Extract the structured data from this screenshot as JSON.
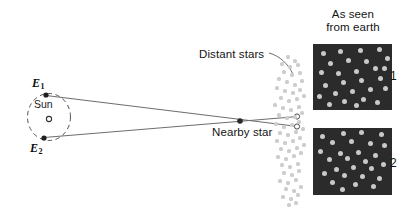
{
  "figure": {
    "colors": {
      "panel_background": "#2b2b2b",
      "star_dot": "#c9c9c9",
      "line": "#6e6e6e",
      "text": "#141414"
    },
    "labels": {
      "distant_stars": "Distant stars",
      "nearby_star": "Nearby star",
      "as_seen_line1": "As seen",
      "as_seen_line2": "from earth",
      "sun": "Sun",
      "earth_position_1": "E",
      "earth_position_1_sub": "1",
      "earth_position_2": "E",
      "earth_position_2_sub": "2",
      "panel_1_number": "1",
      "panel_2_number": "2"
    },
    "panel_1_stars": [
      [
        10,
        9
      ],
      [
        27,
        7
      ],
      [
        47,
        6
      ],
      [
        66,
        5
      ],
      [
        74,
        14
      ],
      [
        17,
        19
      ],
      [
        35,
        16
      ],
      [
        53,
        17
      ],
      [
        62,
        24
      ],
      [
        8,
        28
      ],
      [
        25,
        29
      ],
      [
        43,
        27
      ],
      [
        30,
        38
      ],
      [
        48,
        36
      ],
      [
        67,
        34
      ],
      [
        12,
        41
      ],
      [
        22,
        49
      ],
      [
        39,
        47
      ],
      [
        57,
        45
      ],
      [
        72,
        44
      ],
      [
        6,
        52
      ],
      [
        31,
        57
      ],
      [
        50,
        55
      ],
      [
        64,
        58
      ],
      [
        16,
        60
      ],
      [
        43,
        61
      ],
      [
        71,
        24
      ]
    ],
    "panel_2_stars": [
      [
        9,
        8
      ],
      [
        30,
        5
      ],
      [
        48,
        4
      ],
      [
        68,
        6
      ],
      [
        19,
        14
      ],
      [
        38,
        13
      ],
      [
        57,
        15
      ],
      [
        71,
        17
      ],
      [
        7,
        23
      ],
      [
        27,
        25
      ],
      [
        45,
        24
      ],
      [
        62,
        27
      ],
      [
        16,
        31
      ],
      [
        34,
        30
      ],
      [
        52,
        33
      ],
      [
        40,
        39
      ],
      [
        23,
        41
      ],
      [
        58,
        40
      ],
      [
        70,
        36
      ],
      [
        11,
        45
      ],
      [
        31,
        47
      ],
      [
        49,
        48
      ],
      [
        66,
        50
      ],
      [
        19,
        54
      ],
      [
        42,
        56
      ],
      [
        60,
        58
      ],
      [
        29,
        61
      ]
    ],
    "distant_field_stars": [
      [
        20,
        2
      ],
      [
        27,
        6
      ],
      [
        14,
        9
      ],
      [
        22,
        12
      ],
      [
        30,
        10
      ],
      [
        16,
        17
      ],
      [
        24,
        20
      ],
      [
        32,
        18
      ],
      [
        11,
        24
      ],
      [
        19,
        27
      ],
      [
        27,
        30
      ],
      [
        34,
        26
      ],
      [
        9,
        33
      ],
      [
        17,
        36
      ],
      [
        25,
        38
      ],
      [
        32,
        35
      ],
      [
        13,
        43
      ],
      [
        21,
        46
      ],
      [
        29,
        44
      ],
      [
        36,
        41
      ],
      [
        7,
        50
      ],
      [
        15,
        53
      ],
      [
        23,
        55
      ],
      [
        31,
        52
      ],
      [
        11,
        60
      ],
      [
        19,
        63
      ],
      [
        27,
        62
      ],
      [
        34,
        58
      ],
      [
        8,
        69
      ],
      [
        16,
        72
      ],
      [
        24,
        70
      ],
      [
        31,
        67
      ],
      [
        12,
        78
      ],
      [
        20,
        80
      ],
      [
        28,
        77
      ],
      [
        35,
        74
      ],
      [
        9,
        86
      ],
      [
        17,
        88
      ],
      [
        25,
        86
      ],
      [
        32,
        83
      ],
      [
        13,
        94
      ],
      [
        21,
        96
      ],
      [
        29,
        93
      ],
      [
        36,
        90
      ],
      [
        10,
        102
      ],
      [
        18,
        104
      ],
      [
        26,
        101
      ],
      [
        33,
        98
      ],
      [
        14,
        110
      ],
      [
        22,
        112
      ],
      [
        30,
        109
      ],
      [
        16,
        118
      ],
      [
        24,
        120
      ],
      [
        31,
        116
      ],
      [
        12,
        126
      ],
      [
        20,
        128
      ],
      [
        28,
        125
      ],
      [
        18,
        134
      ],
      [
        26,
        136
      ],
      [
        33,
        132
      ],
      [
        15,
        142
      ],
      [
        23,
        144
      ],
      [
        30,
        140
      ],
      [
        21,
        150
      ],
      [
        28,
        148
      ]
    ]
  }
}
